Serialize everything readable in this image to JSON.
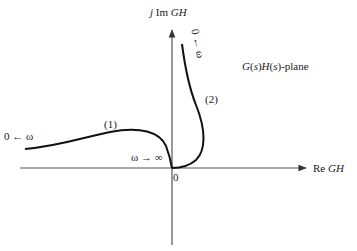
{
  "diagram": {
    "title": "G(s)H(s)-plane",
    "axes": {
      "vertical": {
        "prefix": "j Im ",
        "var": "GH"
      },
      "horizontal": {
        "prefix": "Re ",
        "var": "GH"
      },
      "origin_label": "0"
    },
    "curves": [
      {
        "id": "1",
        "label": "(1)",
        "start_label": "0 ← ω",
        "end_label": "ω → ∞"
      },
      {
        "id": "2",
        "label": "(2)",
        "start_label": "0 ← ω",
        "end_label": "ω → ∞"
      }
    ],
    "colors": {
      "ink": "#1a1a1a",
      "axis": "#333333",
      "background": "#ffffff"
    }
  }
}
